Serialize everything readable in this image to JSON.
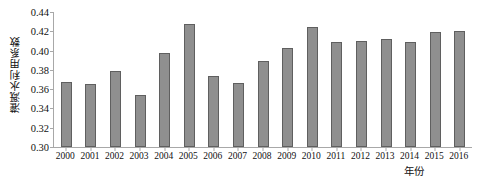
{
  "chart_data": {
    "type": "bar",
    "title": "",
    "xlabel": "年份",
    "ylabel": "灌溉水利用系数",
    "categories": [
      "2000",
      "2001",
      "2002",
      "2003",
      "2004",
      "2005",
      "2006",
      "2007",
      "2008",
      "2009",
      "2010",
      "2011",
      "2012",
      "2013",
      "2014",
      "2015",
      "2016"
    ],
    "values": [
      0.367,
      0.365,
      0.379,
      0.354,
      0.397,
      0.428,
      0.374,
      0.366,
      0.389,
      0.403,
      0.424,
      0.409,
      0.41,
      0.412,
      0.409,
      0.419,
      0.42
    ],
    "ylim": [
      0.3,
      0.44
    ],
    "ytick_labels": [
      "0.44",
      "0.42",
      "0.40",
      "0.38",
      "0.36",
      "0.34",
      "0.32",
      "0.30"
    ],
    "ytick_values": [
      0.44,
      0.42,
      0.4,
      0.38,
      0.36,
      0.34,
      0.32,
      0.3
    ],
    "grid": false,
    "legend": null,
    "series_color": "#8f8f8f",
    "series_border_color": "#5f5f5f",
    "axis_color": "#a8a8a8"
  }
}
